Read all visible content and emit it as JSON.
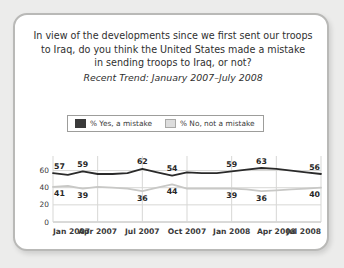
{
  "card": {
    "title_line1": "In view of the developments since we first sent our troops",
    "title_line2": "to Iraq, do you think the United States made a mistake",
    "title_line3": "in sending troops to Iraq, or not?",
    "subtitle": "Recent Trend: January 2007–July 2008"
  },
  "legend": {
    "items": [
      {
        "label": "% Yes, a mistake",
        "color": "#3a3a3a",
        "swatch": "dark"
      },
      {
        "label": "% No, not a mistake",
        "color": "#dddddd",
        "swatch": "light"
      }
    ]
  },
  "chart_data": {
    "type": "line",
    "title": "In view of the developments since we first sent our troops to Iraq, do you think the United States made a mistake in sending troops to Iraq, or not?",
    "subtitle": "Recent Trend: January 2007–July 2008",
    "xlabel": "",
    "ylabel": "",
    "ylim": [
      0,
      70
    ],
    "yticks": [
      0,
      20,
      40,
      60
    ],
    "ytick_labels": [
      "0",
      "20",
      "40",
      "60"
    ],
    "grid": true,
    "legend_position": "top-center",
    "xtick_labels": [
      "Jan 2007",
      "Apr 2007",
      "Jul 2007",
      "Oct 2007",
      "Jan 2008",
      "Apr 2008",
      "Jul 2008"
    ],
    "xtick_positions": [
      0,
      3,
      6,
      9,
      12,
      15,
      18
    ],
    "x": [
      0,
      1,
      2,
      3,
      4,
      5,
      6,
      7,
      8,
      9,
      10,
      11,
      12,
      13,
      14,
      15,
      16,
      17,
      18
    ],
    "series": [
      {
        "name": "% Yes, a mistake",
        "color": "#2a2a2a",
        "values": [
          57,
          55,
          59,
          56,
          56,
          57,
          62,
          58,
          54,
          58,
          57,
          57,
          59,
          61,
          63,
          62,
          60,
          58,
          56
        ],
        "point_labels": [
          {
            "x": 0,
            "value": 57
          },
          {
            "x": 2,
            "value": 59
          },
          {
            "x": 6,
            "value": 62
          },
          {
            "x": 8,
            "value": 54
          },
          {
            "x": 12,
            "value": 59
          },
          {
            "x": 14,
            "value": 63
          },
          {
            "x": 18,
            "value": 56
          }
        ]
      },
      {
        "name": "% No, not a mistake",
        "color": "#c8c8c6",
        "values": [
          41,
          42,
          39,
          41,
          40,
          39,
          36,
          40,
          44,
          39,
          39,
          39,
          39,
          38,
          36,
          37,
          38,
          39,
          40
        ],
        "point_labels": [
          {
            "x": 0,
            "value": 41
          },
          {
            "x": 2,
            "value": 39
          },
          {
            "x": 6,
            "value": 36
          },
          {
            "x": 8,
            "value": 44
          },
          {
            "x": 12,
            "value": 39
          },
          {
            "x": 14,
            "value": 36
          },
          {
            "x": 18,
            "value": 40
          }
        ]
      }
    ]
  }
}
